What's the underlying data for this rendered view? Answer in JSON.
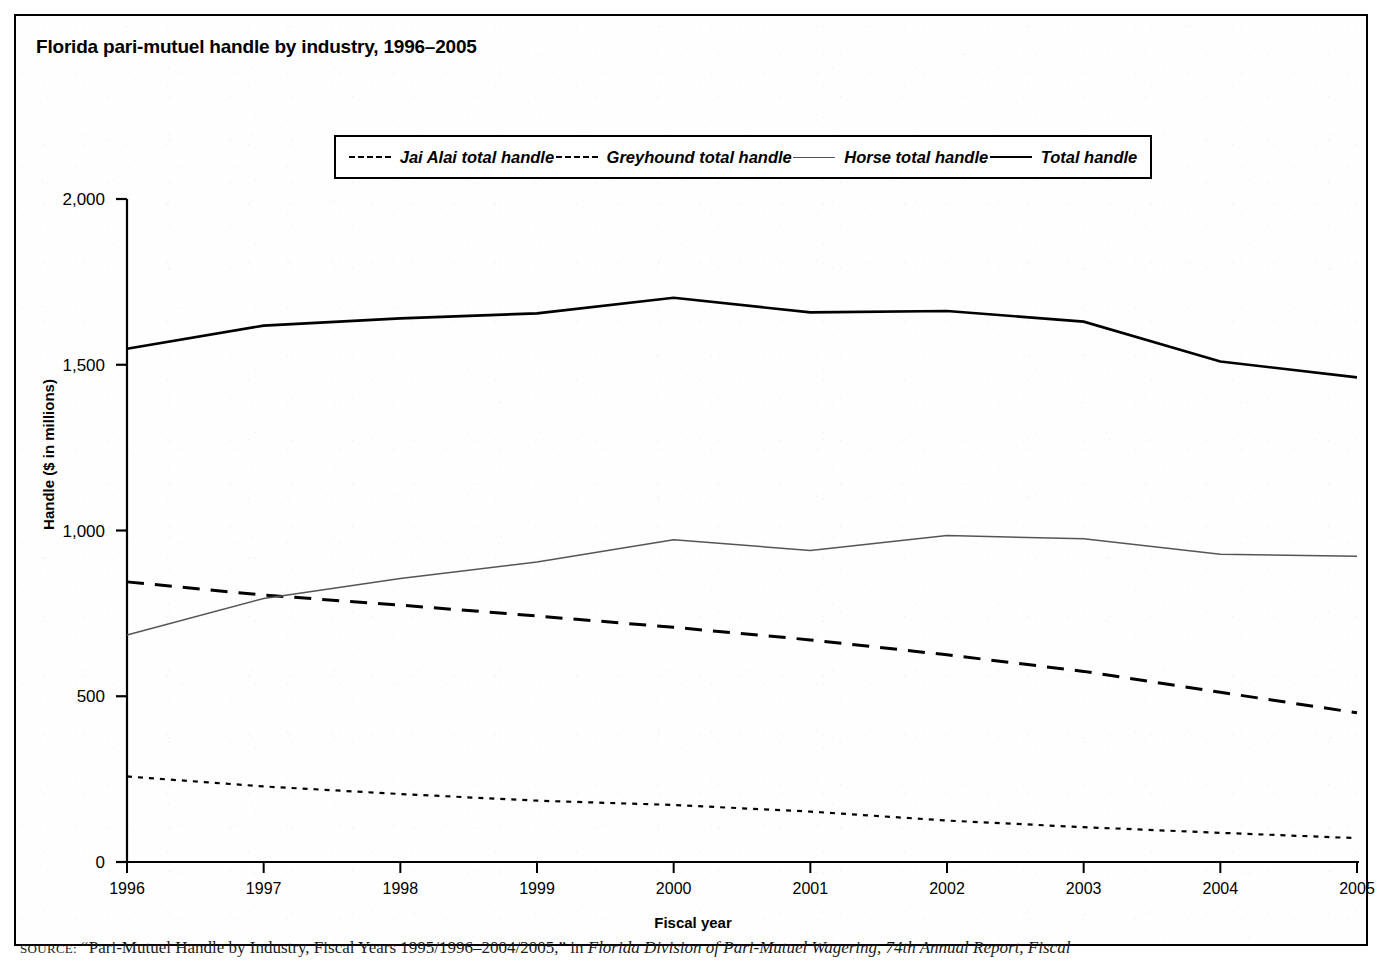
{
  "figure": {
    "title": "Florida pari-mutuel handle by industry, 1996–2005",
    "source_prefix": "SOURCE:",
    "source_quoted": "“Pari-Mutuel Handle by Industry, Fiscal Years 1995/1996–2004/2005,”",
    "source_connector": "in",
    "source_italic": "Florida Division of Pari-Mutuel Wagering, 74th Annual Report, Fiscal"
  },
  "legend": {
    "position": "top-center",
    "items": [
      {
        "label": "Jai Alai total handle",
        "style": "dotted"
      },
      {
        "label": "Greyhound total handle",
        "style": "dashed"
      },
      {
        "label": "Horse total handle",
        "style": "thin-solid"
      },
      {
        "label": "Total handle",
        "style": "thick-solid"
      }
    ]
  },
  "chart_data": {
    "type": "line",
    "title": "Florida pari-mutuel handle by industry, 1996–2005",
    "xlabel": "Fiscal year",
    "ylabel": "Handle ($ in millions)",
    "x": [
      1996,
      1997,
      1998,
      1999,
      2000,
      2001,
      2002,
      2003,
      2004,
      2005
    ],
    "categories": [
      "1996",
      "1997",
      "1998",
      "1999",
      "2000",
      "2001",
      "2002",
      "2003",
      "2004",
      "2005"
    ],
    "xlim": [
      1996,
      2005
    ],
    "ylim": [
      0,
      2000
    ],
    "yticks": [
      0,
      500,
      1000,
      1500,
      2000
    ],
    "ytick_labels": [
      "0",
      "500",
      "1,000",
      "1,500",
      "2,000"
    ],
    "xticks": [
      1996,
      1997,
      1998,
      1999,
      2000,
      2001,
      2002,
      2003,
      2004,
      2005
    ],
    "xtick_labels": [
      "1996",
      "1997",
      "1998",
      "1999",
      "2000",
      "2001",
      "2002",
      "2003",
      "2004",
      "2005"
    ],
    "grid": false,
    "legend_position": "top-center",
    "series": [
      {
        "name": "Jai Alai total handle",
        "style": "dotted",
        "color": "#000000",
        "values": [
          258,
          228,
          205,
          185,
          172,
          152,
          125,
          105,
          88,
          72
        ]
      },
      {
        "name": "Greyhound total handle",
        "style": "dashed",
        "color": "#000000",
        "values": [
          845,
          805,
          775,
          742,
          708,
          670,
          625,
          575,
          512,
          450
        ]
      },
      {
        "name": "Horse total handle",
        "style": "thin-solid",
        "color": "#555555",
        "values": [
          685,
          795,
          855,
          905,
          972,
          940,
          985,
          975,
          928,
          922
        ]
      },
      {
        "name": "Total handle",
        "style": "thick-solid",
        "color": "#000000",
        "values": [
          1548,
          1618,
          1640,
          1655,
          1702,
          1658,
          1662,
          1630,
          1510,
          1462
        ]
      }
    ]
  }
}
